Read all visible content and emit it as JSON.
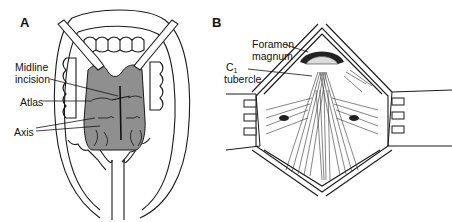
{
  "figure": {
    "panels": [
      {
        "id": "A",
        "letter": "A",
        "description": "Transoral view of open mouth with retractors exposing posterior pharyngeal wall",
        "labels": {
          "midline_incision_line1": "Midline",
          "midline_incision_line2": "incision",
          "atlas": "Atlas",
          "axis": "Axis"
        }
      },
      {
        "id": "B",
        "letter": "B",
        "description": "Posterior surgical exposure with retractors showing suboccipital region",
        "labels": {
          "foramen_magnum_line1": "Foramen",
          "foramen_magnum_line2": "magnum",
          "c1_tubercle_main": "C",
          "c1_tubercle_sub": "1",
          "c1_tubercle_line2": "tubercle"
        }
      }
    ],
    "colors": {
      "line": "#1a1a1a",
      "pharynx_fill": "#8f8f8f",
      "background": "#ffffff",
      "dark_fill": "#222222"
    }
  }
}
